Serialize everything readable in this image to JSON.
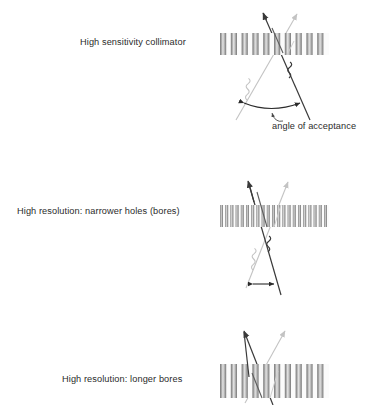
{
  "figure": {
    "title_alt": "Collimator sensitivity and resolution comparison",
    "background_color": "#ffffff",
    "text_color": "#2b2b2b",
    "septa_dark_color": "#6e6e6e",
    "septa_light_color": "#d9d9d9",
    "septa_edge_color": "#8a8a8a",
    "dark_ray_color": "#3a3a3a",
    "light_ray_color": "#c3c3c3",
    "arrow_color": "#2b2b2b"
  },
  "panels": [
    {
      "id": "high-sensitivity",
      "label": "High sensitivity collimator",
      "label_x": 80,
      "label_y": 38,
      "collimator": {
        "x": 220,
        "y": 33,
        "width": 109,
        "height": 22,
        "bore_count": 10,
        "septum_width": 6.2,
        "bore_width": 4.6
      },
      "annotation": {
        "text": "angle of acceptance",
        "x": 272,
        "y": 122
      },
      "acceptance_angle_label": "wide"
    },
    {
      "id": "high-resolution-narrow",
      "label": "High resolution: narrower holes (bores)",
      "label_x": 17,
      "label_y": 207,
      "collimator": {
        "x": 220,
        "y": 205,
        "width": 109,
        "height": 22,
        "bore_count": 21,
        "septum_width": 3.0,
        "bore_width": 2.2
      },
      "annotation": null,
      "acceptance_angle_label": "narrow"
    },
    {
      "id": "high-resolution-long",
      "label": "High resolution: longer bores",
      "label_x": 62,
      "label_y": 375,
      "collimator": {
        "x": 220,
        "y": 364,
        "width": 109,
        "height": 34,
        "bore_count": 10,
        "septum_width": 6.2,
        "bore_width": 4.6
      },
      "annotation": null,
      "acceptance_angle_label": "narrow"
    }
  ],
  "icons": {
    "gamma_ray_dark": "wavy-photon-dark",
    "gamma_ray_light": "wavy-photon-light",
    "acceptance_arc": "double-headed-arc-arrow",
    "leader": "curved-leader-arrow"
  }
}
